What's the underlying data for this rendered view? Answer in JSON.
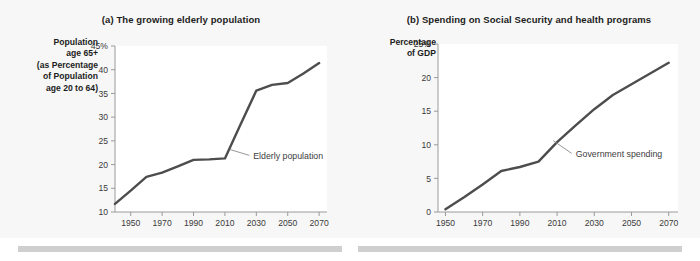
{
  "figure": {
    "background_color": "#fbfbfb",
    "panel_background_color": "#f7f7f7",
    "plot_background_color": "#ffffff",
    "line_color": "#4d4d4d",
    "axis_color": "#9a9a9a"
  },
  "chart_data": [
    {
      "type": "line",
      "panel": "a",
      "title": "(a) The growing elderly population",
      "ylabel": "Population age 65+ (as Percentage of Population age 20 to 64)",
      "ylabel_lines": [
        "Population",
        "age 65+",
        "(as Percentage",
        "of Population",
        "age 20 to 64)"
      ],
      "xlabel": "",
      "xlim": [
        1940,
        2075
      ],
      "ylim": [
        10,
        45
      ],
      "yticks": [
        10,
        15,
        20,
        25,
        30,
        35,
        40,
        45
      ],
      "ytick_labels": [
        "10",
        "15",
        "20",
        "25",
        "30",
        "35",
        "40",
        "45%"
      ],
      "xticks": [
        1950,
        1970,
        1990,
        2010,
        2030,
        2050,
        2070
      ],
      "xtick_labels": [
        "1950",
        "1970",
        "1990",
        "2010",
        "2030",
        "2050",
        "2070"
      ],
      "grid": false,
      "legend": "none",
      "series": [
        {
          "name": "Elderly population",
          "x": [
            1940,
            1950,
            1960,
            1970,
            1980,
            1990,
            2000,
            2010,
            2020,
            2030,
            2040,
            2050,
            2060,
            2070
          ],
          "values": [
            11.7,
            14.5,
            17.4,
            18.3,
            19.6,
            21.0,
            21.1,
            21.3,
            28.5,
            35.6,
            36.8,
            37.2,
            39.2,
            41.4
          ]
        }
      ],
      "annotations": [
        {
          "text": "Elderly population",
          "points_to_x": 2013,
          "points_to_y": 23.2,
          "label_x": 2028,
          "label_y": 21.2
        }
      ]
    },
    {
      "type": "line",
      "panel": "b",
      "title": "(b) Spending on Social Security and health programs",
      "ylabel": "Percentage of GDP",
      "ylabel_lines": [
        "Percentage",
        "of GDP"
      ],
      "xlabel": "",
      "xlim": [
        1946,
        2075
      ],
      "ylim": [
        0,
        25
      ],
      "yticks": [
        0,
        5,
        10,
        15,
        20,
        25
      ],
      "ytick_labels": [
        "0",
        "5",
        "10",
        "15",
        "20",
        "25%"
      ],
      "xticks": [
        1950,
        1970,
        1990,
        2010,
        2030,
        2050,
        2070
      ],
      "xtick_labels": [
        "1950",
        "1970",
        "1990",
        "2010",
        "2030",
        "2050",
        "2070"
      ],
      "grid": false,
      "legend": "none",
      "series": [
        {
          "name": "Government spending",
          "x": [
            1950,
            1960,
            1970,
            1980,
            1990,
            2000,
            2010,
            2020,
            2030,
            2040,
            2050,
            2060,
            2070
          ],
          "values": [
            0.4,
            2.2,
            4.1,
            6.1,
            6.7,
            7.5,
            10.4,
            12.9,
            15.3,
            17.4,
            19.0,
            20.6,
            22.2
          ]
        }
      ],
      "annotations": [
        {
          "text": "Government spending",
          "points_to_x": 2008,
          "points_to_y": 10.6,
          "label_x": 2020,
          "label_y": 8.2
        }
      ]
    }
  ]
}
